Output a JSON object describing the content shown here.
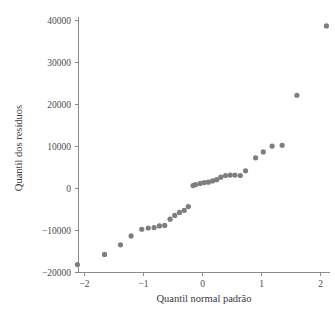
{
  "chart_data": {
    "type": "scatter",
    "title": "",
    "xlabel": "Quantil normal padrão",
    "ylabel": "Quantil dos resíduos",
    "xlim": [
      -2.35,
      2.3
    ],
    "ylim": [
      -20000,
      41000
    ],
    "xticks": [
      -2,
      -1,
      0,
      1,
      2
    ],
    "xticklabels": [
      "−2",
      "−1",
      "0",
      "1",
      "2"
    ],
    "yticks": [
      -20000,
      -10000,
      0,
      10000,
      20000,
      30000,
      40000
    ],
    "yticklabels": [
      "−20000",
      "−10000",
      "0",
      "10000",
      "20000",
      "30000",
      "40000"
    ],
    "grid": false,
    "legend": null,
    "marker_color": "#7d7d82",
    "marker_size": 2.6,
    "axis_color": "#8a8a8a",
    "series": [
      {
        "name": "resíduos",
        "x": [
          -2.12,
          -1.66,
          -1.39,
          -1.21,
          -1.03,
          -0.92,
          -0.82,
          -0.73,
          -0.64,
          -0.55,
          -0.47,
          -0.39,
          -0.31,
          -0.24,
          -0.16,
          -0.12,
          -0.04,
          0.03,
          0.1,
          0.17,
          0.24,
          0.31,
          0.39,
          0.47,
          0.55,
          0.64,
          0.73,
          0.9,
          1.03,
          1.18,
          1.35,
          1.6,
          2.1
        ],
        "y": [
          -18100,
          -15700,
          -13400,
          -11300,
          -9700,
          -9400,
          -9300,
          -8900,
          -8800,
          -7300,
          -6400,
          -5700,
          -5200,
          -4300,
          700,
          900,
          1200,
          1400,
          1500,
          1800,
          2100,
          2700,
          3100,
          3200,
          3200,
          3100,
          4200,
          7300,
          8700,
          10100,
          10300,
          22200,
          38700
        ]
      }
    ]
  },
  "axes": {
    "x_title": "Quantil normal padrão",
    "y_title": "Quantil dos resíduos"
  }
}
